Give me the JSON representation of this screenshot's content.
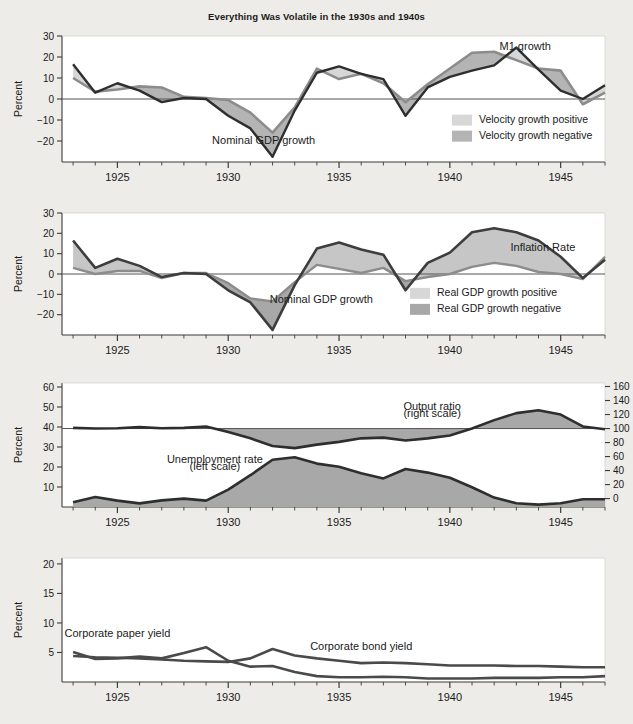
{
  "figure": {
    "title": "Everything Was Volatile in the 1930s and 1940s",
    "background_color": "#eeece8",
    "plot_background_color": "#ffffff",
    "line_color": "#3b3b3b",
    "fill_positive_color": "#d2d2d2",
    "fill_negative_color": "#a9a9a9"
  },
  "panels": [
    {
      "id": "panel-money",
      "ylabel": "Percent",
      "yticks": [
        -30,
        -20,
        -10,
        0,
        10,
        20,
        30
      ],
      "ylim": [
        -30,
        30
      ],
      "xlim": [
        1922.5,
        1947
      ],
      "xticks": [
        1925,
        1930,
        1935,
        1940,
        1945
      ],
      "annotations": [
        {
          "text": "M1 growth",
          "x": 1943.4,
          "y": 23.5
        },
        {
          "text": "Nominal GDP growth",
          "x": 1931.6,
          "y": -21.5
        }
      ],
      "legend": [
        {
          "label": "Velocity growth positive",
          "color": "#d7d7d7"
        },
        {
          "label": "Velocity growth negative",
          "color": "#b4b4b4"
        }
      ]
    },
    {
      "id": "panel-inflation",
      "ylabel": "Percent",
      "yticks": [
        -30,
        -20,
        -10,
        0,
        10,
        20,
        30
      ],
      "ylim": [
        -30,
        30
      ],
      "xlim": [
        1922.5,
        1947
      ],
      "xticks": [
        1925,
        1930,
        1935,
        1940,
        1945
      ],
      "annotations": [
        {
          "text": "Inflation Rate",
          "x": 1944.2,
          "y": 11.5
        },
        {
          "text": "Nominal GDP growth",
          "x": 1934.2,
          "y": -14.5
        }
      ],
      "legend": [
        {
          "label": "Real GDP growth positive",
          "color": "#d7d7d7"
        },
        {
          "label": "Real GDP growth negative",
          "color": "#a8a8a8"
        }
      ]
    },
    {
      "id": "panel-output",
      "ylabel": "Percent",
      "ylabel_right": "Percent",
      "yticks": [
        10,
        20,
        30,
        40,
        50,
        60
      ],
      "ylim": [
        0,
        62
      ],
      "yticks_right": [
        0,
        20,
        40,
        60,
        80,
        100,
        120,
        140,
        160
      ],
      "ylim_right": [
        -12,
        165
      ],
      "xlim": [
        1922.5,
        1947
      ],
      "xticks": [
        1925,
        1930,
        1935,
        1940,
        1945
      ],
      "annotations": [
        {
          "text": "Output ratio",
          "x": 1939.2,
          "y": 48.5
        },
        {
          "text": "(right scale)",
          "x": 1939.2,
          "y": 45.0
        },
        {
          "text": "Unemployment rate",
          "x": 1929.4,
          "y": 22.0
        },
        {
          "text": "(left scale)",
          "x": 1929.4,
          "y": 18.5
        }
      ],
      "legend": []
    },
    {
      "id": "panel-yields",
      "ylabel": "Percent",
      "yticks": [
        5,
        10,
        15,
        20
      ],
      "ylim": [
        0,
        21
      ],
      "xlim": [
        1922.5,
        1947
      ],
      "xticks": [
        1925,
        1930,
        1935,
        1940,
        1945
      ],
      "annotations": [
        {
          "text": "Corporate paper yield",
          "x": 1925.0,
          "y": 7.6
        },
        {
          "text": "Corporate bond yield",
          "x": 1936.0,
          "y": 5.4
        }
      ],
      "legend": []
    }
  ],
  "chart_data": [
    {
      "type": "area",
      "title": "Everything Was Volatile in the 1930s and 1940s",
      "panel": "panel-money",
      "xlabel": "",
      "ylabel": "Percent",
      "ylim": [
        -30,
        30
      ],
      "xlim": [
        1922.5,
        1947
      ],
      "grid": false,
      "legend_position": "lower-right",
      "x": [
        1923,
        1924,
        1925,
        1926,
        1927,
        1928,
        1929,
        1930,
        1931,
        1932,
        1933,
        1934,
        1935,
        1936,
        1937,
        1938,
        1939,
        1940,
        1941,
        1942,
        1943,
        1944,
        1945,
        1946,
        1947
      ],
      "series": [
        {
          "name": "M1 growth",
          "values": [
            10.0,
            3.5,
            4.5,
            6.0,
            5.5,
            1.0,
            0.5,
            -0.5,
            -6.5,
            -16.0,
            -4.0,
            14.5,
            9.5,
            12.0,
            7.5,
            -1.5,
            7.0,
            14.5,
            22.0,
            22.5,
            18.5,
            14.5,
            13.5,
            -2.5,
            3.0
          ]
        },
        {
          "name": "Nominal GDP growth",
          "values": [
            16.5,
            3.0,
            7.5,
            4.0,
            -1.5,
            0.5,
            0.0,
            -8.0,
            -14.0,
            -27.5,
            -5.5,
            12.5,
            15.5,
            12.0,
            9.5,
            -8.0,
            5.5,
            10.5,
            13.5,
            16.0,
            24.5,
            14.0,
            4.0,
            0.0,
            6.5
          ]
        }
      ],
      "legend": [
        "Velocity growth positive",
        "Velocity growth negative"
      ],
      "annotations": [
        "M1 growth",
        "Nominal GDP growth"
      ]
    },
    {
      "type": "area",
      "panel": "panel-inflation",
      "xlabel": "",
      "ylabel": "Percent",
      "ylim": [
        -30,
        30
      ],
      "xlim": [
        1922.5,
        1947
      ],
      "grid": false,
      "legend_position": "lower-right",
      "x": [
        1923,
        1924,
        1925,
        1926,
        1927,
        1928,
        1929,
        1930,
        1931,
        1932,
        1933,
        1934,
        1935,
        1936,
        1937,
        1938,
        1939,
        1940,
        1941,
        1942,
        1943,
        1944,
        1945,
        1946,
        1947
      ],
      "series": [
        {
          "name": "Inflation Rate",
          "values": [
            3.0,
            0.0,
            1.5,
            1.5,
            -2.0,
            0.5,
            0.5,
            -4.5,
            -12.0,
            -13.5,
            -4.0,
            4.5,
            2.5,
            0.5,
            3.0,
            -3.5,
            -1.5,
            0.0,
            3.5,
            5.5,
            4.0,
            1.0,
            0.0,
            -2.5,
            8.5
          ]
        },
        {
          "name": "Nominal GDP growth",
          "values": [
            16.5,
            3.0,
            7.5,
            4.0,
            -1.5,
            0.5,
            0.0,
            -8.0,
            -14.0,
            -27.5,
            -5.5,
            12.5,
            15.5,
            12.0,
            9.5,
            -8.0,
            5.5,
            10.5,
            20.5,
            22.5,
            20.5,
            16.5,
            8.5,
            -2.0,
            7.0
          ]
        }
      ],
      "legend": [
        "Real GDP growth positive",
        "Real GDP growth negative"
      ],
      "annotations": [
        "Inflation Rate",
        "Nominal GDP growth"
      ]
    },
    {
      "type": "area",
      "panel": "panel-output",
      "xlabel": "",
      "ylabel": "Percent",
      "ylabel_right": "Percent",
      "ylim": [
        0,
        62
      ],
      "ylim_right": [
        -12,
        165
      ],
      "xlim": [
        1922.5,
        1947
      ],
      "grid": false,
      "legend_position": "none",
      "x": [
        1923,
        1924,
        1925,
        1926,
        1927,
        1928,
        1929,
        1930,
        1931,
        1932,
        1933,
        1934,
        1935,
        1936,
        1937,
        1938,
        1939,
        1940,
        1941,
        1942,
        1943,
        1944,
        1945,
        1946,
        1947
      ],
      "series": [
        {
          "name": "Unemployment rate (left scale)",
          "values": [
            2.4,
            5.0,
            3.2,
            1.8,
            3.3,
            4.2,
            3.2,
            8.7,
            15.9,
            23.6,
            24.9,
            21.7,
            20.1,
            16.9,
            14.3,
            19.0,
            17.2,
            14.6,
            9.9,
            4.7,
            1.9,
            1.2,
            1.9,
            3.9,
            3.9
          ]
        },
        {
          "name": "Output ratio (right scale)",
          "values": [
            101.0,
            100.0,
            100.5,
            102.0,
            100.5,
            101.0,
            103.0,
            95.0,
            86.0,
            75.0,
            72.0,
            77.0,
            81.0,
            86.0,
            87.0,
            83.0,
            86.0,
            90.0,
            100.0,
            112.0,
            122.0,
            126.0,
            120.0,
            103.0,
            99.0
          ]
        }
      ],
      "legend": [],
      "annotations": [
        "Output ratio (right scale)",
        "Unemployment rate (left scale)"
      ]
    },
    {
      "type": "line",
      "panel": "panel-yields",
      "xlabel": "",
      "ylabel": "Percent",
      "ylim": [
        0,
        21
      ],
      "xlim": [
        1922.5,
        1947
      ],
      "grid": false,
      "legend_position": "none",
      "x": [
        1923,
        1924,
        1925,
        1926,
        1927,
        1928,
        1929,
        1930,
        1931,
        1932,
        1933,
        1934,
        1935,
        1936,
        1937,
        1938,
        1939,
        1940,
        1941,
        1942,
        1943,
        1944,
        1945,
        1946,
        1947
      ],
      "series": [
        {
          "name": "Corporate paper yield",
          "values": [
            5.1,
            3.9,
            4.0,
            4.3,
            4.0,
            4.9,
            5.9,
            3.6,
            2.6,
            2.7,
            1.7,
            1.0,
            0.8,
            0.8,
            0.9,
            0.8,
            0.6,
            0.6,
            0.6,
            0.7,
            0.7,
            0.7,
            0.8,
            0.8,
            1.0
          ]
        },
        {
          "name": "Corporate bond yield",
          "values": [
            4.4,
            4.2,
            4.1,
            4.0,
            3.8,
            3.6,
            3.5,
            3.4,
            4.0,
            5.6,
            4.5,
            4.0,
            3.6,
            3.2,
            3.3,
            3.2,
            3.0,
            2.8,
            2.8,
            2.8,
            2.7,
            2.7,
            2.6,
            2.5,
            2.5
          ]
        }
      ],
      "legend": [],
      "annotations": [
        "Corporate paper yield",
        "Corporate bond yield"
      ]
    }
  ]
}
